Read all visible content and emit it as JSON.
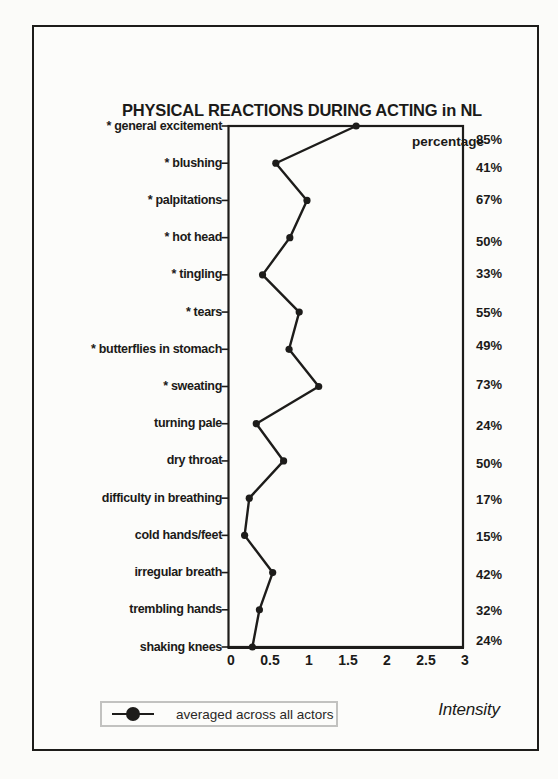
{
  "figure": {
    "title": "PHYSICAL REACTIONS DURING ACTING in NL",
    "right_column_header": "percentage",
    "xaxis_label": "Intensity",
    "legend": {
      "label": "averaged across all actors",
      "marker": "filled-circle-on-line"
    }
  },
  "chart_data": {
    "type": "line",
    "title": "PHYSICAL REACTIONS DURING ACTING in NL",
    "orientation": "categories-on-y-axis",
    "xlabel": "Intensity",
    "xlim": [
      0,
      3
    ],
    "xticks": [
      0,
      0.5,
      1,
      1.5,
      2,
      2.5,
      3
    ],
    "xtick_labels": [
      "0",
      "0.5",
      "1",
      "1.5",
      "2",
      "2.5",
      "3"
    ],
    "grid": false,
    "legend_position": "bottom-left",
    "categories": [
      "* general excitement",
      "* blushing",
      "* palpitations",
      "* hot head",
      "* tingling",
      "* tears",
      "* butterflies in stomach",
      "* sweating",
      "turning pale",
      "dry throat",
      "difficulty in breathing",
      "cold hands/feet",
      "irregular breath",
      "trembling hands",
      "shaking knees"
    ],
    "series": [
      {
        "name": "averaged across all actors",
        "marker": "filled-circle",
        "values": [
          1.63,
          0.6,
          1.0,
          0.78,
          0.43,
          0.9,
          0.77,
          1.15,
          0.35,
          0.7,
          0.26,
          0.2,
          0.56,
          0.39,
          0.3
        ]
      }
    ],
    "percentage_column_header": "percentage",
    "percentages": [
      "85%",
      "41%",
      "67%",
      "50%",
      "33%",
      "55%",
      "49%",
      "73%",
      "24%",
      "50%",
      "17%",
      "15%",
      "42%",
      "32%",
      "24%"
    ]
  },
  "colors": {
    "ink": "#1d1c1a",
    "page": "#fbfbf9",
    "legend_border": "#c2c2c0"
  }
}
